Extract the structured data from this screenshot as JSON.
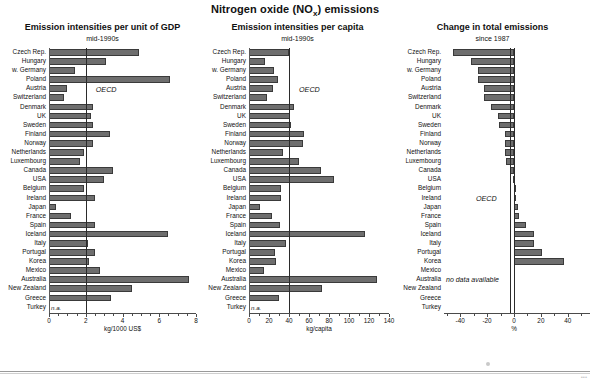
{
  "title_main": "Nitrogen oxide (NO",
  "title_sub": "x",
  "title_tail": ") emissions",
  "footer": {
    "page_mark": "•••"
  },
  "countries": [
    "Czech Rep.",
    "Hungary",
    "w. Germany",
    "Poland",
    "Austria",
    "Switzerland",
    "Denmark",
    "UK",
    "Sweden",
    "Finland",
    "Norway",
    "Netherlands",
    "Luxembourg",
    "Canada",
    "USA",
    "Belgium",
    "Ireland",
    "Japan",
    "France",
    "Spain",
    "Iceland",
    "Italy",
    "Portugal",
    "Korea",
    "Mexico",
    "Australia",
    "New Zealand",
    "Greece",
    "Turkey"
  ],
  "na_label": "n.a.",
  "oecd_label": "OECD",
  "no_data_label": "no data available",
  "colors": {
    "bar": "#6e6e6e",
    "bar_edge": "#3a3a3a",
    "axis": "#4a4a4a",
    "refline": "#2b2b2b"
  },
  "chart_data": [
    {
      "type": "bar",
      "orientation": "horizontal",
      "title": "Emission intensities per unit of GDP",
      "subtitle": "mid-1990s",
      "xlabel": "kg/1000 US$",
      "ylabel": "",
      "xlim": [
        0,
        8
      ],
      "ticks": [
        0,
        2,
        4,
        6,
        8
      ],
      "tick_labels": [
        "0",
        "2",
        "4",
        "6",
        "8"
      ],
      "minor_tick_step": 0.5,
      "grid": false,
      "reference_line": {
        "label": "OECD",
        "value": 2.0
      },
      "categories": [
        "Czech Rep.",
        "Hungary",
        "w. Germany",
        "Poland",
        "Austria",
        "Switzerland",
        "Denmark",
        "UK",
        "Sweden",
        "Finland",
        "Norway",
        "Netherlands",
        "Luxembourg",
        "Canada",
        "USA",
        "Belgium",
        "Ireland",
        "Japan",
        "France",
        "Spain",
        "Iceland",
        "Italy",
        "Portugal",
        "Korea",
        "Mexico",
        "Australia",
        "New Zealand",
        "Greece",
        "Turkey"
      ],
      "values": [
        4.9,
        3.1,
        1.4,
        6.6,
        1.0,
        0.8,
        2.4,
        2.3,
        2.4,
        3.3,
        2.4,
        1.9,
        1.7,
        3.5,
        3.0,
        1.9,
        2.5,
        0.4,
        1.2,
        2.5,
        6.5,
        2.1,
        2.5,
        2.2,
        2.8,
        7.6,
        4.5,
        3.4,
        null
      ],
      "null_note": "n.a."
    },
    {
      "type": "bar",
      "orientation": "horizontal",
      "title": "Emission intensities per capita",
      "subtitle": "mid-1990s",
      "xlabel": "kg/capita",
      "ylabel": "",
      "xlim": [
        0,
        140
      ],
      "ticks": [
        0,
        20,
        40,
        60,
        80,
        100,
        120,
        140
      ],
      "tick_labels": [
        "0",
        "20",
        "40",
        "60",
        "80",
        "100",
        "120",
        "140"
      ],
      "minor_tick_step": 10,
      "grid": false,
      "reference_line": {
        "label": "OECD",
        "value": 40
      },
      "categories": [
        "Czech Rep.",
        "Hungary",
        "w. Germany",
        "Poland",
        "Austria",
        "Switzerland",
        "Denmark",
        "UK",
        "Sweden",
        "Finland",
        "Norway",
        "Netherlands",
        "Luxembourg",
        "Canada",
        "USA",
        "Belgium",
        "Ireland",
        "Japan",
        "France",
        "Spain",
        "Iceland",
        "Italy",
        "Portugal",
        "Korea",
        "Mexico",
        "Australia",
        "New Zealand",
        "Greece",
        "Turkey"
      ],
      "values": [
        40,
        16,
        25,
        29,
        24,
        18,
        45,
        41,
        42,
        55,
        54,
        34,
        50,
        72,
        85,
        32,
        32,
        11,
        23,
        31,
        116,
        37,
        26,
        27,
        15,
        128,
        73,
        30,
        null
      ],
      "null_note": "n.a."
    },
    {
      "type": "bar",
      "orientation": "horizontal",
      "title": "Change in total emissions",
      "subtitle": "since 1987",
      "xlabel": "%",
      "ylabel": "",
      "xlim": [
        -52,
        52
      ],
      "ticks": [
        -40,
        -20,
        0,
        20,
        40
      ],
      "tick_labels": [
        "-40",
        "-20",
        "0",
        "20",
        "40"
      ],
      "minor_tick_step": 10,
      "grid": false,
      "reference_line": {
        "label": "OECD",
        "value": -3
      },
      "zero_line": 0,
      "categories": [
        "Czech Rep.",
        "Hungary",
        "w. Germany",
        "Poland",
        "Austria",
        "Switzerland",
        "Denmark",
        "UK",
        "Sweden",
        "Finland",
        "Norway",
        "Netherlands",
        "Luxembourg",
        "Canada",
        "USA",
        "Belgium",
        "Ireland",
        "Japan",
        "France",
        "Spain",
        "Iceland",
        "Italy",
        "Portugal",
        "Korea",
        "Mexico",
        "Australia",
        "New Zealand",
        "Greece",
        "Turkey"
      ],
      "values": [
        -45,
        -32,
        -27,
        -27,
        -22,
        -22,
        -17,
        -12,
        -11,
        -7,
        -7,
        -7,
        -6,
        -3,
        -1,
        0,
        1,
        3,
        4,
        9,
        15,
        15,
        21,
        37,
        null,
        null,
        null,
        null,
        null
      ],
      "null_note": "no data available"
    }
  ]
}
